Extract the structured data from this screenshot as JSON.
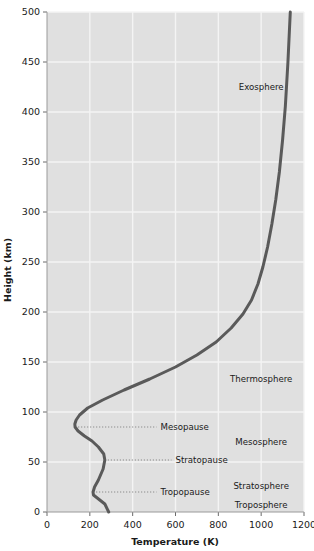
{
  "chart_data": {
    "type": "line",
    "title": "",
    "xlabel": "Temperature (K)",
    "ylabel": "Height (km)",
    "xlim": [
      0,
      1200
    ],
    "ylim": [
      0,
      500
    ],
    "xticks": [
      0,
      200,
      400,
      600,
      800,
      1000,
      1200
    ],
    "yticks": [
      0,
      50,
      100,
      150,
      200,
      250,
      300,
      350,
      400,
      450,
      500
    ],
    "xtick_labels": [
      "0",
      "200",
      "400",
      "600",
      "800",
      "1000",
      "1200"
    ],
    "ytick_labels": [
      "0",
      "50",
      "100",
      "150",
      "200",
      "250",
      "300",
      "350",
      "400",
      "450",
      "500"
    ],
    "grid": true,
    "legend_position": "none",
    "series": [
      {
        "name": "Standard atmosphere temperature profile",
        "color": "#5a5a5a",
        "line_width_px": 3,
        "x": [
          288,
          270,
          217,
          215,
          222,
          240,
          262,
          270,
          265,
          240,
          210,
          175,
          145,
          131,
          130,
          136,
          152,
          190,
          260,
          360,
          480,
          600,
          700,
          790,
          860,
          915,
          955,
          985,
          1008,
          1030,
          1050,
          1068,
          1085,
          1100,
          1113,
          1125,
          1136
        ],
        "y": [
          0,
          8,
          17,
          20,
          25,
          32,
          43,
          52,
          58,
          65,
          71,
          76,
          81,
          85,
          88,
          92,
          97,
          104,
          112,
          122,
          133,
          145,
          157,
          170,
          184,
          198,
          212,
          228,
          245,
          265,
          288,
          312,
          340,
          372,
          406,
          450,
          500
        ]
      }
    ],
    "annotations": {
      "layers": [
        {
          "name": "layer-exosphere",
          "label": "Exosphere",
          "temperature": 1000,
          "height": 425
        },
        {
          "name": "layer-thermosphere",
          "label": "Thermosphere",
          "temperature": 1000,
          "height": 133
        },
        {
          "name": "layer-mesosphere",
          "label": "Mesosphere",
          "temperature": 1000,
          "height": 70
        },
        {
          "name": "layer-stratosphere",
          "label": "Stratosphere",
          "temperature": 1000,
          "height": 26
        },
        {
          "name": "layer-troposphere",
          "label": "Troposphere",
          "temperature": 1000,
          "height": 7
        }
      ],
      "pauses": [
        {
          "name": "pause-mesopause",
          "label": "Mesopause",
          "height": 85,
          "temperature": 131,
          "label_temperature": 530
        },
        {
          "name": "pause-stratopause",
          "label": "Stratopause",
          "height": 52,
          "temperature": 270,
          "label_temperature": 600
        },
        {
          "name": "pause-tropopause",
          "label": "Tropopause",
          "height": 20,
          "temperature": 215,
          "label_temperature": 530
        }
      ]
    }
  },
  "style": {
    "plot_background": "#e0e0e0",
    "page_background": "#ffffff",
    "grid_color": "#f4f4f4",
    "curve_color": "#5a5a5a",
    "text_color": "#1a1a1a",
    "leader_color": "#8a8a8a"
  }
}
